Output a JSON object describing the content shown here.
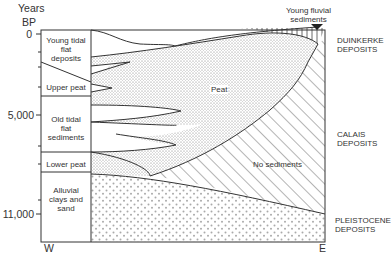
{
  "axis": {
    "title_line1": "Years",
    "title_line2": "BP",
    "ticks": [
      "0",
      "5,000",
      "11,000"
    ],
    "west": "W",
    "east": "E"
  },
  "column_labels": {
    "young_tidal": [
      "Young tidal",
      "flat",
      "deposits"
    ],
    "upper_peat": "Upper peat",
    "old_tidal": [
      "Old tidal",
      "flat",
      "sediments"
    ],
    "lower_peat": "Lower peat",
    "alluvial": [
      "Alluvial",
      "clays and",
      "sand"
    ]
  },
  "area_labels": {
    "peat": "Peat",
    "no_sediments": "No sediments",
    "young_fluvial": [
      "Young fluvial",
      "sediments"
    ]
  },
  "deposit_labels": {
    "duinkerke": [
      "DUINKERKE",
      "DEPOSITS"
    ],
    "calais": [
      "CALAIS",
      "DEPOSITS"
    ],
    "pleistocene": [
      "PLEISTOCENE",
      "DEPOSITS"
    ]
  }
}
